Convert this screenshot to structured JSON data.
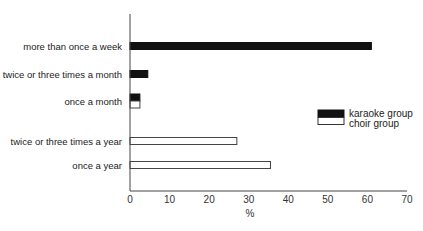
{
  "chart_data": {
    "type": "bar",
    "orientation": "horizontal",
    "title": "",
    "xlabel": "%",
    "ylabel": "",
    "xlim": [
      0,
      70
    ],
    "xticks": [
      0,
      10,
      20,
      30,
      40,
      50,
      60,
      70
    ],
    "grid": false,
    "legend_position": "right-middle",
    "categories": [
      "more than once a week",
      "twice or three times a month",
      "once a month",
      "twice or three times a year",
      "once a year"
    ],
    "series": [
      {
        "name": "karaoke group",
        "color": "#111111",
        "fill": "solid-black",
        "values": [
          61,
          4.5,
          2.5,
          0,
          0
        ]
      },
      {
        "name": "choir group",
        "color": "#ffffff",
        "fill": "white-outlined",
        "values": [
          0,
          0,
          2.5,
          27,
          35.5
        ]
      }
    ]
  },
  "legend": {
    "items": [
      {
        "label": "karaoke group"
      },
      {
        "label": "choir group"
      }
    ]
  },
  "axis": {
    "x_title": "%",
    "ticks": [
      "0",
      "10",
      "20",
      "30",
      "40",
      "50",
      "60",
      "70"
    ]
  }
}
